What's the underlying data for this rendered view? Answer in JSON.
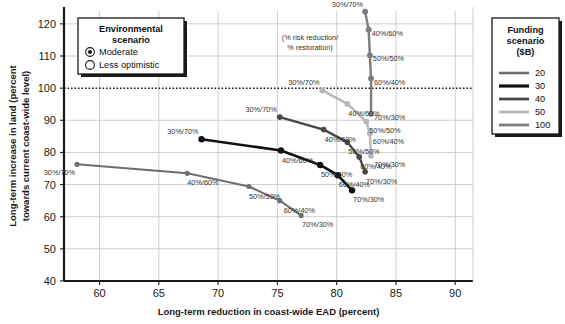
{
  "chart_data": {
    "type": "line",
    "title": "",
    "xlabel": "Long-term reduction in coast-wide EAD (percent)",
    "ylabel": "Long-term increase in land (percent towards current coast-wide level)",
    "xlim": [
      57,
      91.5
    ],
    "ylim": [
      40,
      124
    ],
    "xticks": [
      60,
      65,
      70,
      75,
      80,
      85,
      90
    ],
    "yticks": [
      40,
      50,
      60,
      70,
      80,
      90,
      100,
      110,
      120
    ],
    "grid": true,
    "reference_line": {
      "y": 100,
      "style": "dotted",
      "label": ""
    },
    "annotation": "(% risk reduction/\n% restoration)",
    "annotation_line1": "(% risk reduction/",
    "annotation_line2": "% restoration)",
    "point_label_format": "% risk reduction/% restoration",
    "series": [
      {
        "name": "20",
        "color": "#6e6e6e",
        "width": 2.1,
        "points": [
          {
            "x": 58.1,
            "y": 76.3,
            "label": "30%/70%",
            "lx": -2,
            "ly": 11
          },
          {
            "x": 67.4,
            "y": 73.5,
            "label": "40%/60%",
            "lx": 0,
            "ly": 12
          },
          {
            "x": 72.6,
            "y": 69.4,
            "label": "50%/50%",
            "lx": 0,
            "ly": 12
          },
          {
            "x": 75.2,
            "y": 65.0,
            "label": "60%/40%",
            "lx": 4,
            "ly": 12
          },
          {
            "x": 77.0,
            "y": 60.4,
            "label": "70%/30%",
            "lx": 1,
            "ly": 12
          }
        ]
      },
      {
        "name": "30",
        "color": "#111111",
        "width": 2.6,
        "points": [
          {
            "x": 68.6,
            "y": 84.1,
            "label": "30%/70%",
            "lx": -3,
            "ly": -5
          },
          {
            "x": 75.3,
            "y": 80.6,
            "label": "40%/60%",
            "lx": 1,
            "ly": 12
          },
          {
            "x": 78.6,
            "y": 76.1,
            "label": "50%/50%",
            "lx": 1,
            "ly": 12
          },
          {
            "x": 80.1,
            "y": 72.9,
            "label": "60%/40%",
            "lx": 1,
            "ly": 12
          },
          {
            "x": 81.3,
            "y": 68.2,
            "label": "70%/30%",
            "lx": 1,
            "ly": 12
          }
        ]
      },
      {
        "name": "40",
        "color": "#474747",
        "width": 2.3,
        "points": [
          {
            "x": 75.2,
            "y": 91.0,
            "label": "30%/70%",
            "lx": -3,
            "ly": -5
          },
          {
            "x": 78.9,
            "y": 87.1,
            "label": "40%/60%",
            "lx": 1,
            "ly": 12
          },
          {
            "x": 80.9,
            "y": 83.2,
            "label": "50%/50%",
            "lx": 1,
            "ly": 12
          },
          {
            "x": 81.9,
            "y": 78.6,
            "label": "60%/40%",
            "lx": 1,
            "ly": 12
          },
          {
            "x": 82.4,
            "y": 74.0,
            "label": "70%/30%",
            "lx": 1,
            "ly": 12
          }
        ]
      },
      {
        "name": "50",
        "color": "#b8b8b8",
        "width": 2.4,
        "points": [
          {
            "x": 78.8,
            "y": 99.3,
            "label": "30%/70%",
            "lx": -3,
            "ly": -5
          },
          {
            "x": 80.9,
            "y": 95.1,
            "label": "40%/60%",
            "lx": 1,
            "ly": 12
          },
          {
            "x": 82.5,
            "y": 89.6,
            "label": "50%/50%",
            "lx": 3,
            "ly": 11
          },
          {
            "x": 82.8,
            "y": 86.0,
            "label": "60%/40%",
            "lx": 3,
            "ly": 11
          },
          {
            "x": 82.9,
            "y": 79.0,
            "label": "70%/30%",
            "lx": 3,
            "ly": 11
          }
        ]
      },
      {
        "name": "100",
        "color": "#7d7d7d",
        "width": 2.4,
        "points": [
          {
            "x": 82.4,
            "y": 123.8,
            "label": "30%/70%",
            "lx": -2,
            "ly": -5
          },
          {
            "x": 82.7,
            "y": 118.2,
            "label": "40%/60%",
            "lx": 3,
            "ly": 6
          },
          {
            "x": 82.8,
            "y": 110.2,
            "label": "50%/50%",
            "lx": 3,
            "ly": 6
          },
          {
            "x": 82.9,
            "y": 103.0,
            "label": "60%/40%",
            "lx": 3,
            "ly": 6
          },
          {
            "x": 82.9,
            "y": 92.0,
            "label": "70%/30%",
            "lx": 3,
            "ly": 6
          }
        ]
      }
    ]
  },
  "env_legend": {
    "title_line1": "Environmental",
    "title_line2": "scenario",
    "options": [
      {
        "label": "Moderate",
        "selected": true
      },
      {
        "label": "Less optimistic",
        "selected": false
      }
    ]
  },
  "funding_legend": {
    "title_line1": "Funding",
    "title_line2": "scenario",
    "title_line3": "($B)",
    "entries": [
      {
        "label": "20",
        "color": "#6e6e6e",
        "width": 2.6
      },
      {
        "label": "30",
        "color": "#111111",
        "width": 3.2
      },
      {
        "label": "40",
        "color": "#474747",
        "width": 2.8
      },
      {
        "label": "50",
        "color": "#b8b8b8",
        "width": 2.8
      },
      {
        "label": "100",
        "color": "#7d7d7d",
        "width": 2.8
      }
    ]
  },
  "colors": {
    "axis": "#1a1a1a",
    "grid": "#c8c8c8",
    "text": "#1a1a1a"
  }
}
